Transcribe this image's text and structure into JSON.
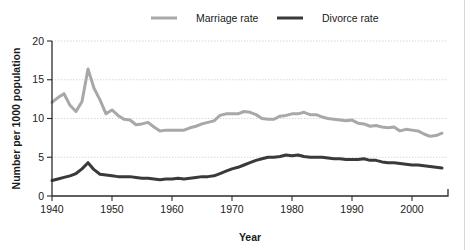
{
  "chart_data": {
    "type": "line",
    "title": "",
    "xlabel": "Year",
    "ylabel": "Number per 1000 population",
    "xlim": [
      1940,
      2006
    ],
    "ylim": [
      0,
      20
    ],
    "xticks": [
      1940,
      1950,
      1960,
      1970,
      1980,
      1990,
      2000
    ],
    "yticks": [
      0,
      5,
      10,
      15,
      20
    ],
    "xtick_labels": [
      "1940",
      "1950",
      "1960",
      "1970",
      "1980",
      "1990",
      "2000"
    ],
    "ytick_labels": [
      "0",
      "5",
      "10",
      "15",
      "20"
    ],
    "grid": true,
    "grid_axis": "y",
    "legend_position": "top-center",
    "x": [
      1940,
      1941,
      1942,
      1943,
      1944,
      1945,
      1946,
      1947,
      1948,
      1949,
      1950,
      1951,
      1952,
      1953,
      1954,
      1955,
      1956,
      1957,
      1958,
      1959,
      1960,
      1961,
      1962,
      1963,
      1964,
      1965,
      1966,
      1967,
      1968,
      1969,
      1970,
      1971,
      1972,
      1973,
      1974,
      1975,
      1976,
      1977,
      1978,
      1979,
      1980,
      1981,
      1982,
      1983,
      1984,
      1985,
      1986,
      1987,
      1988,
      1989,
      1990,
      1991,
      1992,
      1993,
      1994,
      1995,
      1996,
      1997,
      1998,
      1999,
      2000,
      2001,
      2002,
      2003,
      2004,
      2005
    ],
    "series": [
      {
        "name": "Marriage rate",
        "color": "#a8a8a8",
        "line_width": 3.0,
        "values": [
          12.1,
          12.7,
          13.2,
          11.7,
          10.9,
          12.2,
          16.4,
          13.9,
          12.4,
          10.6,
          11.1,
          10.4,
          9.9,
          9.8,
          9.2,
          9.3,
          9.5,
          8.9,
          8.4,
          8.5,
          8.5,
          8.5,
          8.5,
          8.8,
          9.0,
          9.3,
          9.5,
          9.7,
          10.4,
          10.6,
          10.6,
          10.6,
          10.9,
          10.8,
          10.5,
          10.0,
          9.9,
          9.9,
          10.3,
          10.4,
          10.6,
          10.6,
          10.8,
          10.5,
          10.5,
          10.2,
          10.0,
          9.9,
          9.8,
          9.7,
          9.8,
          9.4,
          9.3,
          9.0,
          9.1,
          8.9,
          8.8,
          8.9,
          8.4,
          8.6,
          8.5,
          8.4,
          8.0,
          7.7,
          7.8,
          8.1
        ]
      },
      {
        "name": "Divorce rate",
        "color": "#3a3a3a",
        "line_width": 3.0,
        "values": [
          2.0,
          2.2,
          2.4,
          2.6,
          2.9,
          3.5,
          4.3,
          3.4,
          2.8,
          2.7,
          2.6,
          2.5,
          2.5,
          2.5,
          2.4,
          2.3,
          2.3,
          2.2,
          2.1,
          2.2,
          2.2,
          2.3,
          2.2,
          2.3,
          2.4,
          2.5,
          2.5,
          2.6,
          2.9,
          3.2,
          3.5,
          3.7,
          4.0,
          4.3,
          4.6,
          4.8,
          5.0,
          5.0,
          5.1,
          5.3,
          5.2,
          5.3,
          5.1,
          5.0,
          5.0,
          5.0,
          4.9,
          4.8,
          4.8,
          4.7,
          4.7,
          4.7,
          4.8,
          4.6,
          4.6,
          4.4,
          4.3,
          4.3,
          4.2,
          4.1,
          4.0,
          4.0,
          3.9,
          3.8,
          3.7,
          3.6
        ]
      }
    ],
    "legend": [
      {
        "label": "Marriage rate",
        "color": "#a8a8a8"
      },
      {
        "label": "Divorce rate",
        "color": "#3a3a3a"
      }
    ]
  }
}
